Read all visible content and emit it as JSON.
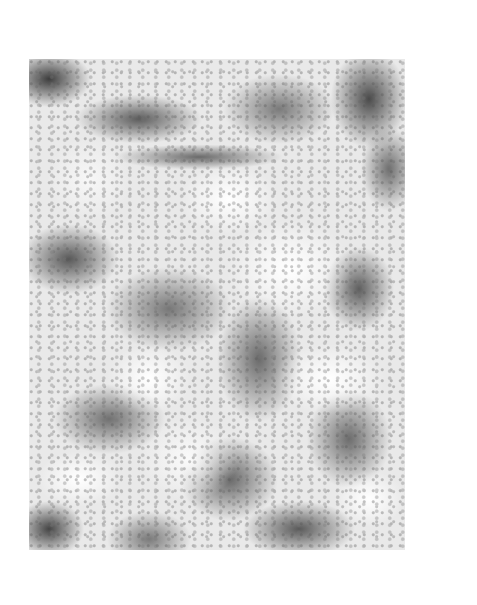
{
  "image": {
    "description": "Abstract grayscale mottled texture print on white background",
    "palette": {
      "background": "#ffffff",
      "light": "#e9e9e9",
      "mid": "#777777",
      "dark": "#3d3d3d"
    },
    "frame": {
      "left": 29,
      "top": 59,
      "width": 376,
      "height": 491
    }
  }
}
